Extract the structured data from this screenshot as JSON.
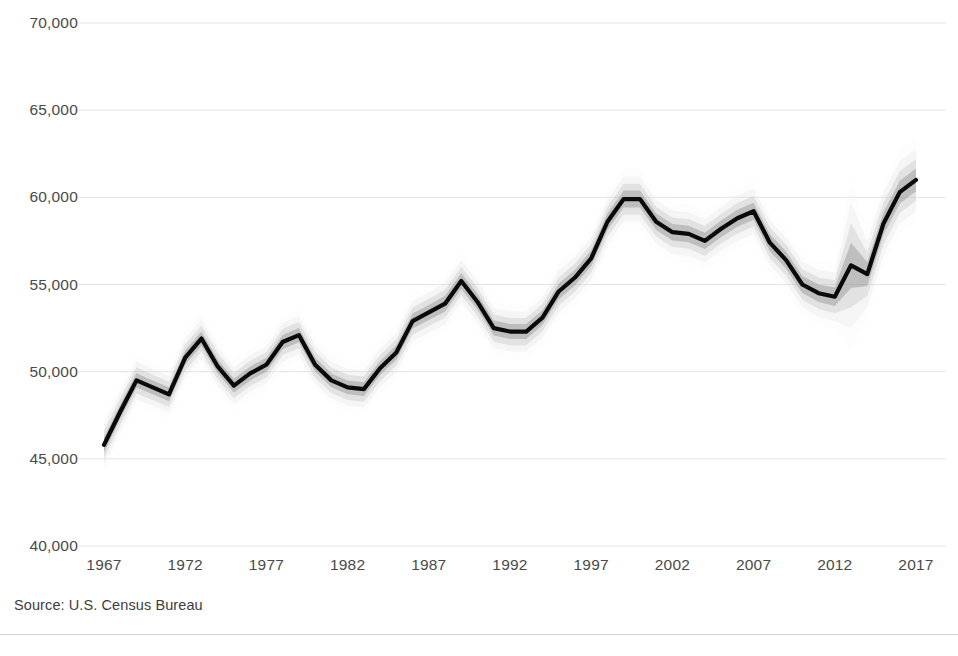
{
  "source_note": "Source: U.S. Census Bureau",
  "colors": {
    "background": "#ffffff",
    "line": "#0a0a0a",
    "gridline": "#e3e3e5",
    "text": "#4a4a4a",
    "band_core": "#8c8c8c",
    "band_mid": "#b5b5b5",
    "band_outer": "#d9d9d9",
    "band_faint": "#efefef"
  },
  "chart_data": {
    "type": "line",
    "title": "",
    "subtitle": "",
    "xlabel": "",
    "ylabel": "",
    "grid": true,
    "legend": false,
    "xlim": [
      1967,
      2017
    ],
    "ylim": [
      40000,
      70000
    ],
    "y_ticks": [
      40000,
      45000,
      50000,
      55000,
      60000,
      65000,
      70000
    ],
    "y_tick_labels": [
      "40,000",
      "45,000",
      "50,000",
      "55,000",
      "60,000",
      "65,000",
      "70,000"
    ],
    "x_ticks": [
      1967,
      1972,
      1977,
      1982,
      1987,
      1992,
      1997,
      2002,
      2007,
      2012,
      2017
    ],
    "x_tick_labels": [
      "1967",
      "1972",
      "1977",
      "1982",
      "1987",
      "1992",
      "1997",
      "2002",
      "2007",
      "2012",
      "2017"
    ],
    "x": [
      1967,
      1968,
      1969,
      1970,
      1971,
      1972,
      1973,
      1974,
      1975,
      1976,
      1977,
      1978,
      1979,
      1980,
      1981,
      1982,
      1983,
      1984,
      1985,
      1986,
      1987,
      1988,
      1989,
      1990,
      1991,
      1992,
      1993,
      1994,
      1995,
      1996,
      1997,
      1998,
      1999,
      2000,
      2001,
      2002,
      2003,
      2004,
      2005,
      2006,
      2007,
      2008,
      2009,
      2010,
      2011,
      2012,
      2013,
      2014,
      2015,
      2016,
      2017
    ],
    "series": [
      {
        "name": "Median household income",
        "values": [
          45800,
          47700,
          49500,
          49100,
          48700,
          50800,
          51900,
          50300,
          49200,
          49900,
          50400,
          51700,
          52100,
          50400,
          49500,
          49100,
          49000,
          50200,
          51100,
          52900,
          53400,
          53900,
          55200,
          54000,
          52500,
          52300,
          52300,
          53100,
          54600,
          55400,
          56500,
          58600,
          59900,
          59900,
          58600,
          58000,
          57900,
          57500,
          58200,
          58800,
          59200,
          57400,
          56400,
          55000,
          54500,
          54300,
          56100,
          55600,
          58500,
          60300,
          61000
        ]
      }
    ],
    "bands": {
      "description": "Nested uncertainty / confidence bands around the median line (widest band ~90%, narrowest ~50%); band width expands sharply in 2013 due to survey methodology change.",
      "levels": [
        {
          "name": "outermost",
          "opacity": 0.12,
          "half_width": [
            1600,
            1500,
            1500,
            1450,
            1450,
            1500,
            1500,
            1500,
            1450,
            1450,
            1450,
            1500,
            1500,
            1500,
            1450,
            1450,
            1450,
            1500,
            1500,
            1550,
            1550,
            1600,
            1650,
            1600,
            1550,
            1550,
            1550,
            1550,
            1600,
            1600,
            1650,
            1700,
            1750,
            1750,
            1700,
            1700,
            1700,
            1700,
            1700,
            1750,
            1750,
            1750,
            1750,
            1750,
            1800,
            1900,
            5000,
            2600,
            2400,
            2400,
            2400
          ]
        },
        {
          "name": "outer",
          "opacity": 0.2,
          "half_width": [
            1150,
            1100,
            1100,
            1050,
            1050,
            1100,
            1100,
            1100,
            1050,
            1050,
            1050,
            1100,
            1100,
            1100,
            1050,
            1050,
            1050,
            1100,
            1100,
            1150,
            1150,
            1200,
            1200,
            1150,
            1150,
            1150,
            1150,
            1150,
            1200,
            1200,
            1200,
            1250,
            1300,
            1300,
            1250,
            1250,
            1250,
            1250,
            1250,
            1300,
            1300,
            1300,
            1300,
            1300,
            1350,
            1400,
            3600,
            1900,
            1800,
            1800,
            1800
          ]
        },
        {
          "name": "mid",
          "opacity": 0.3,
          "half_width": [
            780,
            750,
            750,
            720,
            720,
            750,
            750,
            750,
            720,
            720,
            720,
            750,
            750,
            750,
            720,
            720,
            720,
            750,
            750,
            780,
            780,
            800,
            820,
            800,
            780,
            780,
            780,
            780,
            800,
            800,
            820,
            850,
            880,
            880,
            850,
            850,
            850,
            850,
            850,
            880,
            880,
            880,
            880,
            880,
            900,
            950,
            2400,
            1250,
            1200,
            1200,
            1200
          ]
        },
        {
          "name": "inner",
          "opacity": 0.42,
          "half_width": [
            430,
            410,
            410,
            400,
            400,
            410,
            410,
            410,
            400,
            400,
            400,
            410,
            410,
            410,
            400,
            400,
            400,
            410,
            410,
            430,
            430,
            450,
            460,
            450,
            430,
            430,
            430,
            430,
            450,
            450,
            460,
            470,
            490,
            490,
            470,
            470,
            470,
            470,
            470,
            490,
            490,
            490,
            490,
            490,
            500,
            530,
            1300,
            680,
            650,
            650,
            650
          ]
        }
      ]
    }
  }
}
